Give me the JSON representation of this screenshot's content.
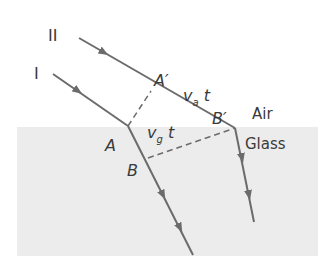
{
  "diagram": {
    "rays": [
      {
        "label": "I"
      },
      {
        "label": "II"
      }
    ],
    "points": {
      "A": "A",
      "A_prime": "A′",
      "B": "B",
      "B_prime": "B′"
    },
    "distances": {
      "air": {
        "v": "v",
        "sub": "a",
        "t": "t"
      },
      "glass": {
        "v": "v",
        "sub": "g",
        "t": "t"
      }
    },
    "media": {
      "upper": "Air",
      "lower": "Glass"
    },
    "colors": {
      "ray": "#6b6b6b",
      "glass": "#ececec",
      "text": "#3a3a3a"
    }
  }
}
